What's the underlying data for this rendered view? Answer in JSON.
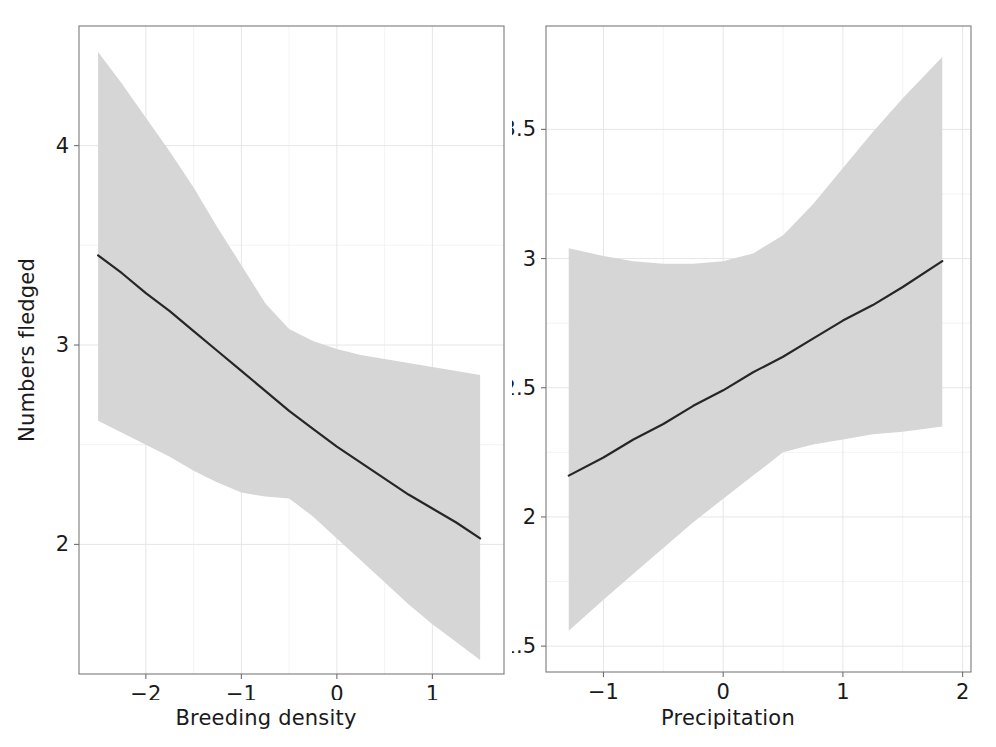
{
  "figure": {
    "background_color": "#ffffff",
    "ribbon_color": "#d6d6d6",
    "line_color": "#262626",
    "grid_color": "#e6e6e6",
    "frame_color": "#7a7a7a"
  },
  "panels": {
    "left": {
      "ylabel": "Numbers fledged",
      "xlabel": "Breeding density",
      "x_ticks": [
        "-2",
        "-1",
        "0",
        "1"
      ],
      "y_ticks": [
        "4",
        "3",
        "2"
      ]
    },
    "right": {
      "ylabel": "",
      "xlabel": "Precipitation",
      "x_ticks": [
        "-1",
        "0",
        "1",
        "2"
      ],
      "y_ticks": [
        "3.5",
        "3.0",
        "2.5",
        "2.0",
        "1.5"
      ]
    }
  },
  "chart_data": [
    {
      "type": "line",
      "title": "",
      "xlabel": "Breeding density",
      "ylabel": "Numbers fledged",
      "xlim": [
        -2.7,
        1.75
      ],
      "ylim": [
        1.35,
        4.6
      ],
      "xticks": [
        -2,
        -1,
        0,
        1
      ],
      "yticks": [
        4,
        3,
        2
      ],
      "grid": true,
      "legend": null,
      "series": [
        {
          "name": "fitted",
          "x": [
            -2.5,
            -2.25,
            -2.0,
            -1.75,
            -1.5,
            -1.25,
            -1.0,
            -0.75,
            -0.5,
            -0.25,
            0.0,
            0.25,
            0.5,
            0.75,
            1.0,
            1.25,
            1.5
          ],
          "values": [
            3.45,
            3.36,
            3.26,
            3.17,
            3.07,
            2.97,
            2.87,
            2.77,
            2.67,
            2.58,
            2.49,
            2.41,
            2.33,
            2.25,
            2.18,
            2.11,
            2.03
          ]
        },
        {
          "name": "ci_upper",
          "x": [
            -2.5,
            -2.25,
            -2.0,
            -1.75,
            -1.5,
            -1.25,
            -1.0,
            -0.75,
            -0.5,
            -0.25,
            0.0,
            0.25,
            0.5,
            0.75,
            1.0,
            1.25,
            1.5
          ],
          "values": [
            4.47,
            4.31,
            4.14,
            3.97,
            3.79,
            3.59,
            3.4,
            3.21,
            3.08,
            3.02,
            2.98,
            2.95,
            2.93,
            2.91,
            2.89,
            2.87,
            2.85
          ]
        },
        {
          "name": "ci_lower",
          "x": [
            -2.5,
            -2.25,
            -2.0,
            -1.75,
            -1.5,
            -1.25,
            -1.0,
            -0.75,
            -0.5,
            -0.25,
            0.0,
            0.25,
            0.5,
            0.75,
            1.0,
            1.25,
            1.5
          ],
          "values": [
            2.62,
            2.56,
            2.5,
            2.44,
            2.37,
            2.31,
            2.26,
            2.24,
            2.23,
            2.14,
            2.03,
            1.92,
            1.81,
            1.7,
            1.6,
            1.51,
            1.42
          ]
        }
      ]
    },
    {
      "type": "line",
      "title": "",
      "xlabel": "Precipitation",
      "ylabel": "",
      "xlim": [
        -1.48,
        2.07
      ],
      "ylim": [
        1.4,
        3.9
      ],
      "xticks": [
        -1,
        0,
        1,
        2
      ],
      "yticks": [
        3.5,
        3.0,
        2.5,
        2.0,
        1.5
      ],
      "grid": true,
      "legend": null,
      "series": [
        {
          "name": "fitted",
          "x": [
            -1.29,
            -1.0,
            -0.75,
            -0.5,
            -0.25,
            0.0,
            0.25,
            0.5,
            0.75,
            1.0,
            1.25,
            1.5,
            1.83
          ],
          "values": [
            2.16,
            2.23,
            2.3,
            2.36,
            2.43,
            2.49,
            2.56,
            2.62,
            2.69,
            2.76,
            2.82,
            2.89,
            2.99
          ]
        },
        {
          "name": "ci_upper",
          "x": [
            -1.29,
            -1.0,
            -0.75,
            -0.5,
            -0.25,
            0.0,
            0.25,
            0.5,
            0.75,
            1.0,
            1.25,
            1.5,
            1.83
          ],
          "values": [
            3.04,
            3.01,
            2.99,
            2.98,
            2.98,
            2.99,
            3.02,
            3.09,
            3.21,
            3.35,
            3.49,
            3.62,
            3.78
          ]
        },
        {
          "name": "ci_lower",
          "x": [
            -1.29,
            -1.0,
            -0.75,
            -0.5,
            -0.25,
            0.0,
            0.25,
            0.5,
            0.75,
            1.0,
            1.25,
            1.5,
            1.83
          ],
          "values": [
            1.56,
            1.68,
            1.78,
            1.88,
            1.98,
            2.07,
            2.16,
            2.25,
            2.28,
            2.3,
            2.32,
            2.33,
            2.35
          ]
        }
      ]
    }
  ]
}
